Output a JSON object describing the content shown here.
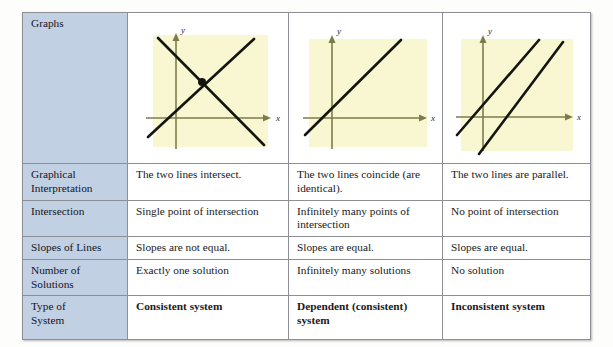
{
  "table": {
    "rows": [
      {
        "id": "graphs",
        "header": "Graphs",
        "type": "graphs",
        "cells": [
          {
            "name": "graph-intersecting-lines",
            "description": "two lines crossing at one point with intersection dot",
            "x_axis_label": "x",
            "y_axis_label": "y"
          },
          {
            "name": "graph-coincident-lines",
            "description": "one line (two identical coincident lines)",
            "x_axis_label": "x",
            "y_axis_label": "y"
          },
          {
            "name": "graph-parallel-lines",
            "description": "two parallel lines that never meet",
            "x_axis_label": "x",
            "y_axis_label": "y"
          }
        ]
      },
      {
        "id": "graphical-interpretation",
        "header": "Graphical\nInterpretation",
        "header_line1": "Graphical",
        "header_line2": "Interpretation",
        "type": "text",
        "cells": [
          "The two lines intersect.",
          "The two lines coincide (are identical).",
          "The two lines are parallel."
        ]
      },
      {
        "id": "intersection",
        "header": "Intersection",
        "type": "text",
        "cells": [
          "Single point of intersection",
          "Infinitely many points of intersection",
          "No point of intersection"
        ]
      },
      {
        "id": "slopes-of-lines",
        "header": "Slopes of Lines",
        "type": "text",
        "cells": [
          "Slopes are not equal.",
          "Slopes are equal.",
          "Slopes are equal."
        ]
      },
      {
        "id": "number-of-solutions",
        "header": "Number of Solutions",
        "header_line1": "Number of",
        "header_line2": "Solutions",
        "type": "text",
        "cells": [
          "Exactly one solution",
          "Infinitely many solutions",
          "No solution"
        ]
      },
      {
        "id": "type-of-system",
        "header": "Type of System",
        "header_line1": "Type of",
        "header_line2": "System",
        "type": "text-bold",
        "cells": [
          "Consistent system",
          "Dependent (consistent) system",
          "Inconsistent system"
        ]
      }
    ]
  },
  "colors": {
    "row_header_background": "#c2d0e4",
    "graph_plot_background": "#f8f7d2",
    "graph_axis": "#7c7c4a",
    "graph_line": "#15150f",
    "table_border": "#8d8f95",
    "page_background": "#fdfdfb"
  }
}
